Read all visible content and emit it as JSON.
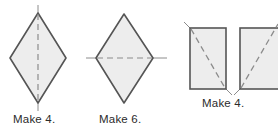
{
  "figure": {
    "type": "quilting-pattern-cutting-diagram",
    "background_color": "#ffffff",
    "shape_fill": "#ededed",
    "shape_stroke": "#555555",
    "dashed_line_color": "#8c8c8c",
    "tick_line_color": "#8c8c8c",
    "caption_color": "#2b2b2b"
  },
  "units": [
    {
      "id": "diamond-vertical",
      "shape": "diamond",
      "fold_line": "vertical",
      "caption": "Make 4.",
      "geometry": {
        "top": [
          38,
          13
        ],
        "right": [
          66,
          58
        ],
        "bottom": [
          38,
          103
        ],
        "left": [
          10,
          58
        ]
      },
      "dashed_line": {
        "x1": 38,
        "y1": 13,
        "x2": 38,
        "y2": 103
      },
      "tick_top": {
        "x1": 38,
        "y1": 5,
        "x2": 38,
        "y2": 13
      },
      "tick_bottom": {
        "x1": 38,
        "y1": 103,
        "x2": 38,
        "y2": 111
      }
    },
    {
      "id": "diamond-horizontal",
      "shape": "diamond",
      "fold_line": "horizontal",
      "caption": "Make 6.",
      "geometry": {
        "top": [
          124,
          14
        ],
        "right": [
          153,
          58
        ],
        "bottom": [
          124,
          103
        ],
        "left": [
          96,
          58
        ]
      },
      "dashed_line": {
        "x1": 96,
        "y1": 58,
        "x2": 153,
        "y2": 58
      },
      "tick_left": {
        "x1": 86,
        "y1": 58,
        "x2": 96,
        "y2": 58
      },
      "tick_right": {
        "x1": 153,
        "y1": 58,
        "x2": 167,
        "y2": 58
      }
    },
    {
      "id": "rectangle-pair",
      "shape": "rectangle-pair",
      "caption": "Make 4.",
      "rect_left": {
        "x": 190,
        "y": 28,
        "width": 36,
        "height": 61
      },
      "rect_right": {
        "x": 240,
        "y": 28,
        "width": 44,
        "height": 61
      },
      "diagonal_left": {
        "x1": 184,
        "y1": 22,
        "x2": 232,
        "y2": 95
      },
      "diagonal_right": {
        "x1": 234,
        "y1": 95,
        "x2": 284,
        "y2": 22
      }
    }
  ],
  "captions": {
    "diamond_vertical": "Make 4.",
    "diamond_horizontal": "Make 6.",
    "rectangles": "Make 4."
  }
}
